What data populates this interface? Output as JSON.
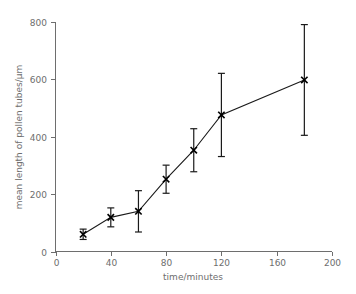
{
  "chart_data": {
    "type": "line",
    "title": "",
    "xlabel": "time/minutes",
    "ylabel": "mean length of pollen tubes/µm",
    "xlim": [
      0,
      200
    ],
    "ylim": [
      0,
      800
    ],
    "xticks": [
      0,
      40,
      80,
      120,
      160,
      200
    ],
    "yticks": [
      0,
      200,
      400,
      600,
      800
    ],
    "grid": false,
    "legend": false,
    "marker": "x",
    "error_bars": true,
    "x": [
      20,
      40,
      60,
      80,
      100,
      120,
      180
    ],
    "values": [
      60,
      119,
      140,
      252,
      353,
      476,
      598
    ],
    "errors": [
      18,
      33,
      72,
      49,
      75,
      145,
      193
    ],
    "series": [
      {
        "name": "mean length of pollen tubes",
        "points": [
          {
            "x": 20,
            "y": 60,
            "err": 18,
            "low": 42,
            "high": 78
          },
          {
            "x": 40,
            "y": 119,
            "err": 33,
            "low": 86,
            "high": 152
          },
          {
            "x": 60,
            "y": 140,
            "err": 72,
            "low": 68,
            "high": 212
          },
          {
            "x": 80,
            "y": 252,
            "err": 49,
            "low": 203,
            "high": 301
          },
          {
            "x": 100,
            "y": 353,
            "err": 75,
            "low": 278,
            "high": 428
          },
          {
            "x": 120,
            "y": 476,
            "err": 145,
            "low": 331,
            "high": 621
          },
          {
            "x": 180,
            "y": 598,
            "err": 193,
            "low": 405,
            "high": 791
          }
        ]
      }
    ],
    "colors": {
      "line": "#1a1a1a",
      "marker": "#000000",
      "error": "#1a1a1a",
      "axis": "#6e6e6e",
      "text": "#6e6e6e",
      "background": "#ffffff"
    }
  },
  "axes": {
    "x_tick_labels": [
      "0",
      "40",
      "80",
      "120",
      "160",
      "200"
    ],
    "y_tick_labels": [
      "0",
      "200",
      "400",
      "600",
      "800"
    ],
    "x_title": "time/minutes",
    "y_title": "mean length of pollen tubes/µm"
  }
}
